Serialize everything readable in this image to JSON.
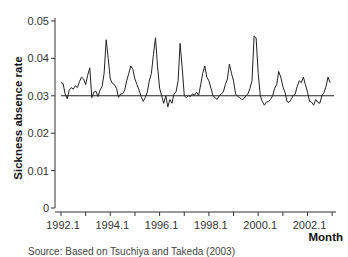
{
  "chart_data": {
    "type": "line",
    "title": "",
    "xlabel": "Month",
    "ylabel": "Sickness absence rate",
    "xticks": [
      "1992.1",
      "1994.1",
      "1996.1",
      "1998.1",
      "2000.1",
      "2002.1"
    ],
    "yticks": [
      "0",
      "0.01",
      "0.02",
      "0.03",
      "0.04",
      "0.05"
    ],
    "ylim": [
      0,
      0.05
    ],
    "xlim": [
      1992.0,
      2003.5
    ],
    "grid": false,
    "legend": null,
    "reference_line": {
      "y": 0.03,
      "label": ""
    },
    "series": [
      {
        "name": "Sickness absence rate",
        "start": "1992.1",
        "frequency": "monthly",
        "values": [
          0.0335,
          0.0333,
          0.0305,
          0.0292,
          0.0315,
          0.0322,
          0.0318,
          0.0327,
          0.0322,
          0.0338,
          0.035,
          0.0345,
          0.033,
          0.0355,
          0.0375,
          0.0295,
          0.031,
          0.0312,
          0.0298,
          0.0315,
          0.0325,
          0.036,
          0.045,
          0.04,
          0.0345,
          0.0333,
          0.033,
          0.032,
          0.0296,
          0.0305,
          0.0305,
          0.0315,
          0.034,
          0.036,
          0.038,
          0.037,
          0.0345,
          0.033,
          0.0315,
          0.0298,
          0.0285,
          0.0295,
          0.031,
          0.034,
          0.036,
          0.041,
          0.0455,
          0.038,
          0.032,
          0.03,
          0.028,
          0.03,
          0.027,
          0.029,
          0.028,
          0.0305,
          0.031,
          0.034,
          0.044,
          0.0375,
          0.03,
          0.0295,
          0.03,
          0.0298,
          0.0305,
          0.0302,
          0.031,
          0.03,
          0.033,
          0.036,
          0.038,
          0.035,
          0.034,
          0.032,
          0.03,
          0.0295,
          0.029,
          0.03,
          0.0305,
          0.031,
          0.033,
          0.0345,
          0.0385,
          0.036,
          0.034,
          0.0305,
          0.0298,
          0.0295,
          0.029,
          0.0292,
          0.03,
          0.0305,
          0.032,
          0.034,
          0.046,
          0.0455,
          0.036,
          0.03,
          0.0285,
          0.0275,
          0.0283,
          0.0285,
          0.029,
          0.03,
          0.032,
          0.033,
          0.0365,
          0.035,
          0.0325,
          0.031,
          0.0285,
          0.0282,
          0.029,
          0.03,
          0.0305,
          0.0325,
          0.034,
          0.0335,
          0.035,
          0.033,
          0.031,
          0.0285,
          0.0283,
          0.0275,
          0.029,
          0.0282,
          0.028,
          0.03,
          0.0308,
          0.0325,
          0.035,
          0.0335
        ]
      }
    ]
  },
  "caption": {
    "text": "Source: Based on Tsuchiya and Takeda (2003)"
  }
}
